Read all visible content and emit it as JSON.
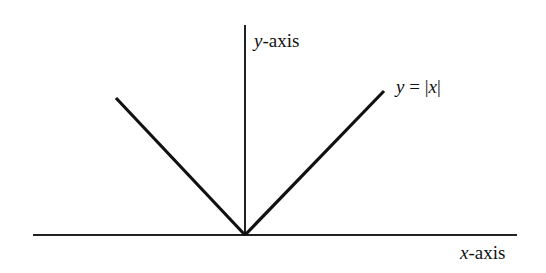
{
  "diagram": {
    "y_axis_label": {
      "var": "y",
      "rest": "-axis"
    },
    "x_axis_label": {
      "var": "x",
      "rest": "-axis"
    },
    "curve_label": {
      "lhs": "y",
      "eq": " = |",
      "var": "x",
      "close": "|"
    },
    "function": "y = |x|",
    "colors": {
      "line": "#111111",
      "background": "#ffffff"
    }
  }
}
